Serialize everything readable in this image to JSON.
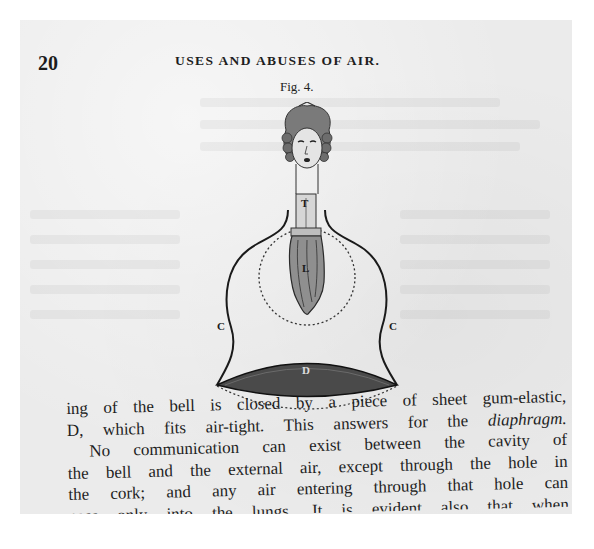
{
  "page": {
    "number": "20",
    "running_head": "USES AND ABUSES OF AIR."
  },
  "figure": {
    "caption": "Fig. 4.",
    "labels": {
      "trachea": "T",
      "lungs": "L",
      "bell_left": "C",
      "bell_right": "C",
      "diaphragm": "D"
    }
  },
  "body": {
    "lines": [
      {
        "text": "ing of the bell is closed by a piece of sheet gum-elastic,"
      },
      {
        "text": "D, which fits air-tight.  This answers for the ",
        "emphasis": "diaphragm."
      },
      {
        "text": "No communication can exist between the cavity of"
      },
      {
        "text": "the bell and the external air, except through the hole in"
      },
      {
        "text": "the cork; and any air entering through that hole can"
      },
      {
        "text": "pass only into the lungs. It is evident also that when"
      }
    ]
  },
  "colors": {
    "paper": "#ebebeb",
    "ink": "#1e1e1e",
    "margin": "#ffffff"
  }
}
